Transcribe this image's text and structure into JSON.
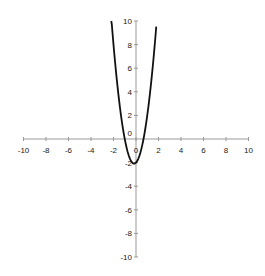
{
  "chart_data": {
    "type": "line",
    "title": "",
    "xlabel": "",
    "ylabel": "",
    "xlim": [
      -10,
      10
    ],
    "ylim": [
      -10,
      10
    ],
    "grid": false,
    "legend": null,
    "x_ticks": [
      -10,
      -8,
      -6,
      -4,
      -2,
      0,
      2,
      4,
      6,
      8,
      10
    ],
    "y_ticks": [
      -10,
      -8,
      -6,
      -4,
      -2,
      0,
      2,
      4,
      6,
      8,
      10
    ],
    "series": [
      {
        "name": "y = 3x^2 + x - 2",
        "color": "#111111",
        "x": [
          -2.2,
          -2.0,
          -1.8,
          -1.6,
          -1.4,
          -1.2,
          -1.0,
          -0.8,
          -0.6,
          -0.4,
          -0.2,
          0.0,
          0.2,
          0.4,
          0.6,
          0.8,
          1.0,
          1.2,
          1.4,
          1.6,
          1.8
        ],
        "y": [
          10.32,
          8.0,
          5.92,
          4.08,
          2.48,
          1.12,
          0.0,
          -0.88,
          -1.52,
          -1.92,
          -2.08,
          -2.0,
          -1.68,
          -1.12,
          -0.32,
          0.72,
          2.0,
          3.52,
          5.28,
          7.28,
          9.52
        ]
      }
    ]
  },
  "axes": {
    "axis_color": "#999999",
    "x_tick_labels": [
      "-10",
      "-8",
      "-6",
      "-4",
      "-2",
      "0",
      "2",
      "4",
      "6",
      "8",
      "10"
    ],
    "y_tick_labels": [
      "10",
      "8",
      "6",
      "4",
      "2",
      "0",
      "-2",
      "-4",
      "-6",
      "-8",
      "-10"
    ]
  }
}
